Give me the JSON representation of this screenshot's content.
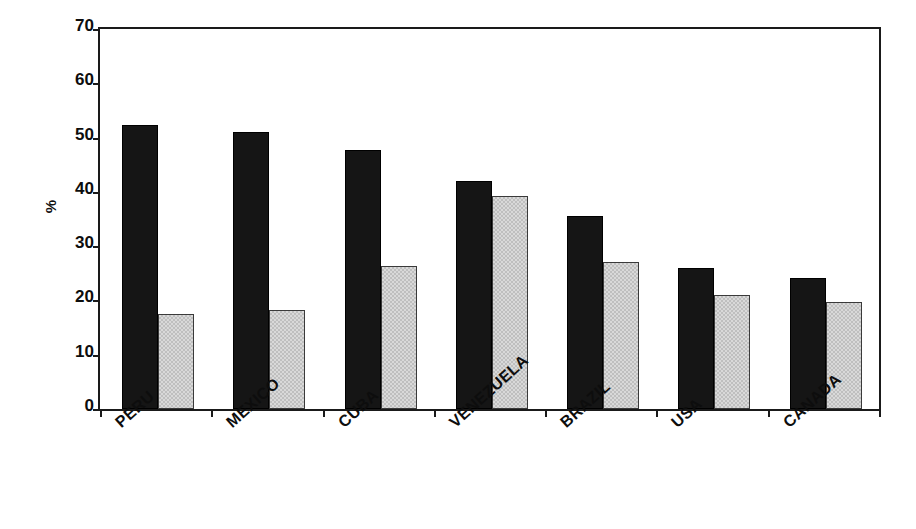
{
  "chart_data": {
    "type": "bar",
    "title": "",
    "subtitle": "",
    "xlabel": "",
    "ylabel": "%",
    "ylim": [
      0,
      70
    ],
    "yticks": [
      0,
      10,
      20,
      30,
      40,
      50,
      60,
      70
    ],
    "grid": false,
    "legend": "none",
    "categories": [
      "PERU",
      "MEXICO",
      "CUBA",
      "VENEZUELA",
      "BRAZIL",
      "USA",
      "CANADA"
    ],
    "series": [
      {
        "name": "series-1",
        "color": "#151515",
        "values": [
          52.3,
          51.1,
          47.8,
          42.0,
          35.5,
          26.0,
          24.2
        ]
      },
      {
        "name": "series-2",
        "color": "#d9d9d9",
        "values": [
          17.5,
          18.2,
          26.3,
          39.3,
          27.0,
          21.0,
          19.8
        ]
      }
    ]
  },
  "axis": {
    "y_label": "%",
    "tick_labels": [
      "70",
      "60",
      "50",
      "40",
      "30",
      "20",
      "10",
      "0"
    ]
  },
  "categories": [
    {
      "label": "PERU"
    },
    {
      "label": "MEXICO"
    },
    {
      "label": "CUBA"
    },
    {
      "label": "VENEZUELA"
    },
    {
      "label": "BRAZIL"
    },
    {
      "label": "USA"
    },
    {
      "label": "CANADA"
    }
  ]
}
